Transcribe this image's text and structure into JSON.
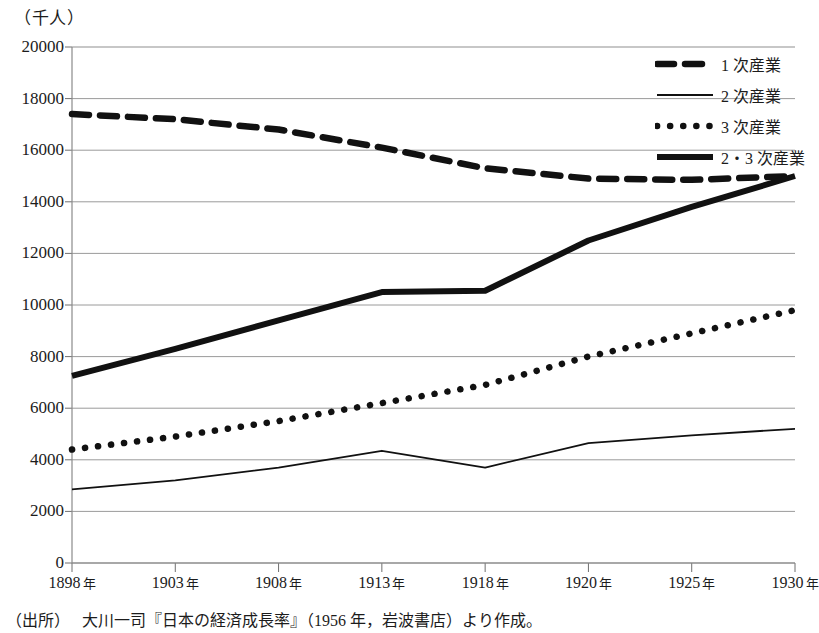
{
  "unit_label": "（千人）",
  "source": {
    "label": "（出所）",
    "text": "大川一司『日本の経済成長率』（1956 年，岩波書店）より作成。"
  },
  "legend": {
    "items": [
      {
        "label": "1 次産業",
        "style": "dashed",
        "icon": "dashed-line-icon"
      },
      {
        "label": "2 次産業",
        "style": "thin-solid",
        "icon": "thin-line-icon"
      },
      {
        "label": "3 次産業",
        "style": "dotted",
        "icon": "dotted-line-icon"
      },
      {
        "label": "2・3 次産業",
        "style": "thick-solid",
        "icon": "thick-line-icon"
      }
    ]
  },
  "yticks": [
    "0",
    "2000",
    "4000",
    "6000",
    "8000",
    "10000",
    "12000",
    "14000",
    "16000",
    "18000",
    "20000"
  ],
  "xticks": [
    {
      "year": "1898",
      "suffix": "年"
    },
    {
      "year": "1903",
      "suffix": "年"
    },
    {
      "year": "1908",
      "suffix": "年"
    },
    {
      "year": "1913",
      "suffix": "年"
    },
    {
      "year": "1918",
      "suffix": "年"
    },
    {
      "year": "1920",
      "suffix": "年"
    },
    {
      "year": "1925",
      "suffix": "年"
    },
    {
      "year": "1930",
      "suffix": "年"
    }
  ],
  "chart_data": {
    "type": "line",
    "title": "",
    "xlabel": "",
    "ylabel": "（千人）",
    "ylim": [
      0,
      20000
    ],
    "ytick_step": 2000,
    "grid": true,
    "legend_position": "top-right",
    "categories": [
      "1898",
      "1903",
      "1908",
      "1913",
      "1918",
      "1920",
      "1925",
      "1930"
    ],
    "series": [
      {
        "name": "1 次産業",
        "style": "dashed",
        "values": [
          17400,
          17200,
          16800,
          16100,
          15300,
          14900,
          14850,
          15000
        ]
      },
      {
        "name": "2 次産業",
        "style": "thin-solid",
        "values": [
          2850,
          3200,
          3700,
          4350,
          3700,
          4650,
          4950,
          5200
        ]
      },
      {
        "name": "3 次産業",
        "style": "dotted",
        "values": [
          4400,
          4900,
          5500,
          6200,
          6900,
          8000,
          8900,
          9800
        ]
      },
      {
        "name": "2・3 次産業",
        "style": "thick-solid",
        "values": [
          7250,
          8300,
          9400,
          10500,
          10550,
          12500,
          13800,
          15000
        ]
      }
    ]
  }
}
